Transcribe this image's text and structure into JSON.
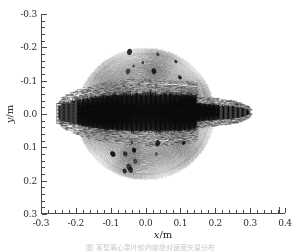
{
  "figure": {
    "background_color": "#ffffff",
    "foreground_color": "#2b2b2b",
    "caption": "图 某型离心泵叶轮内部绝对速度矢量分布"
  },
  "axes": {
    "x_title": "x",
    "x_unit": "/m",
    "y_title": "y",
    "y_unit": "/m",
    "x_ticklabels": [
      "-0.3",
      "-0.2",
      "-0.1",
      "0.0",
      "0.1",
      "0.2",
      "0.3",
      "0.4"
    ],
    "y_ticklabels": [
      "0.3",
      "0.2",
      "0.1",
      "0.0",
      "-0.1",
      "-0.2",
      "-0.3"
    ]
  },
  "chart_data": {
    "type": "scatter",
    "plot_kind": "quiver-vector-field",
    "title": "",
    "subtitle": "",
    "xlabel": "x/m",
    "ylabel": "y/m",
    "xlim": [
      -0.3,
      0.4
    ],
    "ylim": [
      -0.3,
      0.3
    ],
    "x_major_ticks": [
      -0.3,
      -0.2,
      -0.1,
      0.0,
      0.1,
      0.2,
      0.3,
      0.4
    ],
    "y_major_ticks": [
      -0.3,
      -0.2,
      -0.1,
      0.0,
      0.1,
      0.2,
      0.3
    ],
    "x_minor_tick_step": 0.02,
    "y_minor_tick_step": 0.02,
    "grid": false,
    "legend": null,
    "legend_position": "none",
    "spines_visible": [
      "left",
      "bottom"
    ],
    "colormap": "grayscale",
    "arrow_color": "#111111",
    "domain": {
      "shape": "circle",
      "center_x": 0.0,
      "center_y": 0.0,
      "radius": 0.2
    },
    "inlet_duct": {
      "shape": "rectangle",
      "x_min": -0.255,
      "x_max": -0.205,
      "y_min": -0.028,
      "y_max": 0.032,
      "hatch": "horizontal-stripes"
    },
    "jet": {
      "description": "high-velocity horizontal jet from left inlet through circle centre exiting right",
      "x_start": -0.25,
      "x_end": 0.3,
      "y_center": 0.005,
      "half_width_min": 0.018,
      "half_width_max": 0.058
    },
    "vector_grid": {
      "nx": 150,
      "ny": 126,
      "arrow_length_scale": 0.012
    },
    "series": [
      {
        "name": "absolute velocity vectors",
        "units": "m/s",
        "value_min": 0.0,
        "value_max": 1.0
      }
    ]
  }
}
